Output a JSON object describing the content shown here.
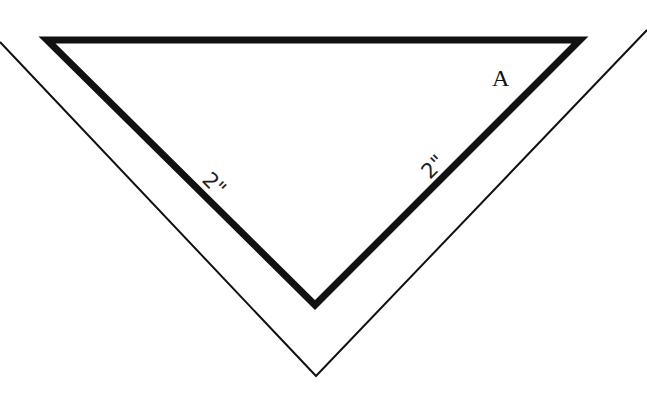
{
  "diagram": {
    "type": "geometry",
    "shapes": {
      "inner_triangle": {
        "description": "Right isosceles triangle, thick outline, hypotenuse on top",
        "vertices": [
          [
            47,
            40
          ],
          [
            580,
            40
          ],
          [
            315,
            305
          ]
        ],
        "stroke": "#111111",
        "stroke_width": 7
      },
      "outer_angle": {
        "description": "Thin V-shaped outline offset around the triangle",
        "points": [
          [
            0,
            42
          ],
          [
            316,
            376
          ],
          [
            647,
            30
          ]
        ],
        "stroke": "#111111",
        "stroke_width": 2
      }
    },
    "labels": {
      "vertex_label": "A",
      "left_leg": "2\"",
      "right_leg": "2\""
    }
  }
}
